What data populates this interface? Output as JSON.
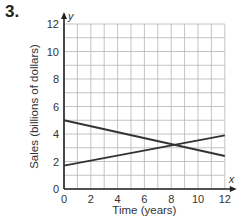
{
  "problem_number": "3.",
  "chart_data": {
    "type": "line",
    "title": "",
    "xlabel": "Time (years)",
    "ylabel": "Sales (billions of dollars)",
    "x_axis_letter": "x",
    "y_axis_letter": "y",
    "xlim": [
      0,
      12
    ],
    "ylim": [
      0,
      12
    ],
    "x_ticks": [
      0,
      2,
      4,
      6,
      8,
      10,
      12
    ],
    "y_ticks": [
      0,
      2,
      4,
      6,
      8,
      10,
      12
    ],
    "grid": true,
    "grid_step": 1,
    "legend": null,
    "series": [
      {
        "name": "Line A (decreasing)",
        "x": [
          0,
          12
        ],
        "y": [
          5,
          2.4
        ]
      },
      {
        "name": "Line B (increasing)",
        "x": [
          0,
          12
        ],
        "y": [
          1.7,
          3.9
        ]
      }
    ],
    "intersection": {
      "x": 8,
      "y": 3.2
    }
  },
  "colors": {
    "grid": "#b5b5b5",
    "axis": "#222222",
    "line": "#333333"
  }
}
